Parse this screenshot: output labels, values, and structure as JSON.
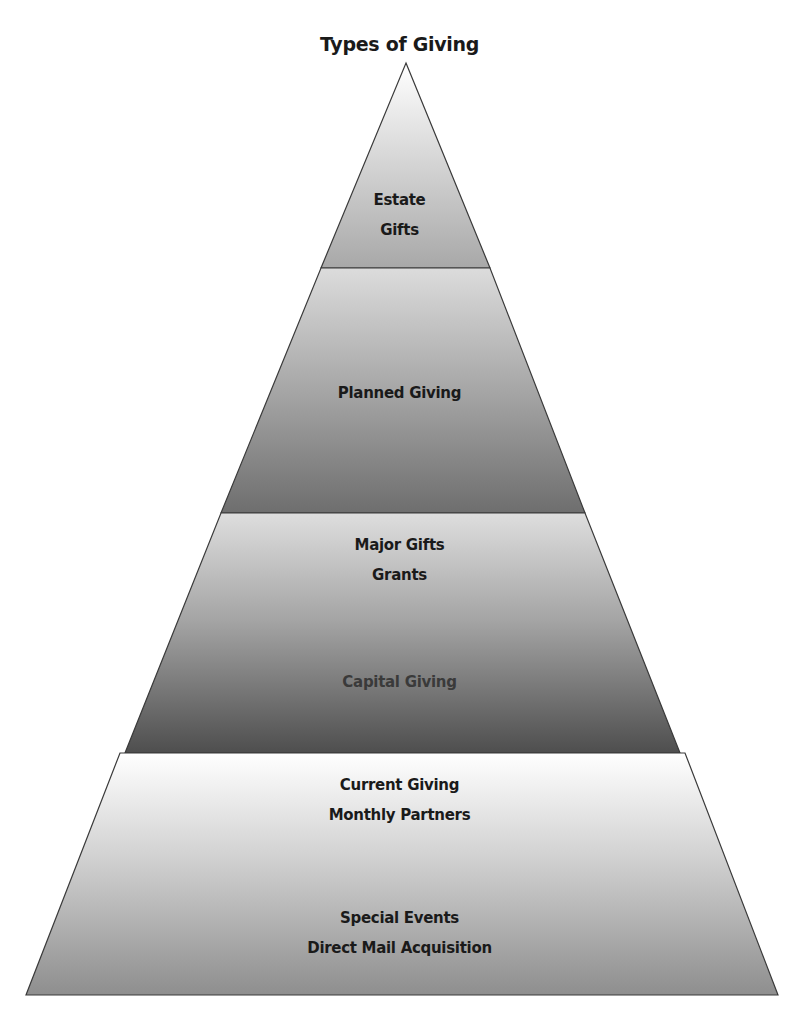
{
  "title": "Types of Giving",
  "tiers": [
    {
      "name": "estate",
      "lines": [
        "Estate",
        "Gifts"
      ]
    },
    {
      "name": "planned",
      "lines": [
        "Planned Giving"
      ]
    },
    {
      "name": "major",
      "lines": [
        "Major Gifts",
        "Grants"
      ],
      "bottom_lines": [
        "Capital Giving"
      ]
    },
    {
      "name": "current",
      "lines": [
        "Current Giving",
        "Monthly Partners"
      ],
      "bottom_lines": [
        "Special Events",
        "Direct Mail Acquisition"
      ]
    }
  ],
  "colors": {
    "outline": "#3a3a3a",
    "light": "#f7f7f7",
    "mid": "#b0b0b0",
    "dark": "#5a5a5a"
  }
}
